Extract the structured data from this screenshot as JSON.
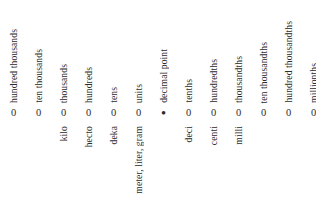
{
  "chart_data": {
    "type": "table",
    "orientation": "vertical-labels",
    "columns": [
      {
        "digit": "0",
        "place": "hundred thousands",
        "prefix": ""
      },
      {
        "digit": "0",
        "place": "ten thousands",
        "prefix": ""
      },
      {
        "digit": "0",
        "place": "thousands",
        "prefix": "kilo"
      },
      {
        "digit": "0",
        "place": "hundreds",
        "prefix": "hecto"
      },
      {
        "digit": "0",
        "place": "tens",
        "prefix": "deka"
      },
      {
        "digit": "0",
        "place": "units",
        "prefix": "meter, liter, gram"
      },
      {
        "digit": "•",
        "place": "decimal point",
        "prefix": ""
      },
      {
        "digit": "0",
        "place": "tenths",
        "prefix": "deci"
      },
      {
        "digit": "0",
        "place": "hundredths",
        "prefix": "centi"
      },
      {
        "digit": "0",
        "place": "thousandths",
        "prefix": "milli"
      },
      {
        "digit": "0",
        "place": "ten thousandths",
        "prefix": ""
      },
      {
        "digit": "0",
        "place": "hundred thousandths",
        "prefix": ""
      },
      {
        "digit": "0",
        "place": "millionths",
        "prefix": ""
      }
    ],
    "text_color": "#2b2b2b",
    "background_color": "#ffffff"
  }
}
